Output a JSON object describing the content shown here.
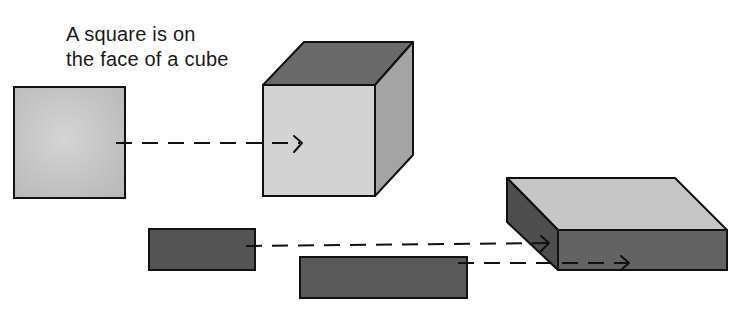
{
  "caption": {
    "line1": "A square is on",
    "line2": "the face of a cube"
  },
  "colors": {
    "outline": "#111111",
    "light_fill": "#cfcfcf",
    "mid_fill": "#a9a9a9",
    "dark_fill": "#5e5e5e",
    "darker_fill": "#4f4f4f",
    "background": "#ffffff"
  },
  "shapes": {
    "square": {
      "label": "square",
      "x": 14,
      "y": 87,
      "w": 111,
      "h": 111
    },
    "cube": {
      "label": "cube"
    },
    "rect_small": {
      "label": "small rectangle",
      "x": 149,
      "y": 229,
      "w": 106,
      "h": 41
    },
    "rect_large": {
      "label": "large rectangle",
      "x": 300,
      "y": 257,
      "w": 167,
      "h": 41
    },
    "slab": {
      "label": "rectangular prism"
    }
  },
  "arrows": [
    {
      "name": "square-to-cube-arrow",
      "from": "square",
      "to": "cube front face"
    },
    {
      "name": "small-rect-to-slab-arrow",
      "from": "small rectangle",
      "to": "prism side face"
    },
    {
      "name": "large-rect-to-slab-arrow",
      "from": "large rectangle",
      "to": "prism front face"
    }
  ]
}
